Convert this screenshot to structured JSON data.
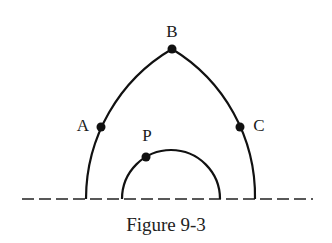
{
  "figure": {
    "caption": "Figure 9-3",
    "points": {
      "A": {
        "label": "A",
        "x": 101,
        "y": 127,
        "label_x": 82,
        "label_y": 125
      },
      "B": {
        "label": "B",
        "x": 172,
        "y": 49,
        "label_x": 172,
        "label_y": 30
      },
      "C": {
        "label": "C",
        "x": 240,
        "y": 127,
        "label_x": 258,
        "label_y": 125
      },
      "P": {
        "label": "P",
        "x": 146,
        "y": 157,
        "label_x": 147,
        "label_y": 135
      }
    },
    "baseline": {
      "y": 199,
      "x_start": 22,
      "x_end": 313,
      "style": "dashed"
    },
    "outer_arch": {
      "left_foot_x": 86,
      "right_foot_x": 255,
      "apex": "B",
      "type": "pointed-arch"
    },
    "inner_arc": {
      "left_foot_x": 122,
      "right_foot_x": 220,
      "top_y": 150,
      "type": "semicircle"
    },
    "colors": {
      "stroke": "#111111",
      "background": "#ffffff"
    }
  }
}
